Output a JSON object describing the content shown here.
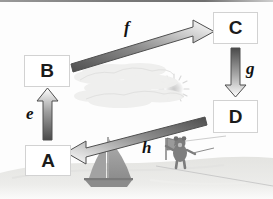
{
  "diagram": {
    "nodes": [
      {
        "id": "A",
        "label": "A",
        "position": "bottom-left"
      },
      {
        "id": "B",
        "label": "B",
        "position": "upper-left"
      },
      {
        "id": "C",
        "label": "C",
        "position": "top-right"
      },
      {
        "id": "D",
        "label": "D",
        "position": "middle-right"
      }
    ],
    "edges": [
      {
        "id": "e",
        "label": "e",
        "from": "A",
        "to": "B",
        "direction": "up"
      },
      {
        "id": "f",
        "label": "f",
        "from": "B",
        "to": "C",
        "direction": "up-right"
      },
      {
        "id": "g",
        "label": "g",
        "from": "C",
        "to": "D",
        "direction": "down"
      },
      {
        "id": "h",
        "label": "h",
        "from": "D",
        "to": "A",
        "direction": "down-left"
      }
    ],
    "colors": {
      "arrow_dark": "#5f5f5f",
      "arrow_light": "#d8d8d8",
      "arrow_outline": "#4a4a4a",
      "box_border": "#d2d2d2",
      "box_fill": "#ffffff",
      "text": "#1b1b1b",
      "ground": "#e8e8e6",
      "sky": "#fdfdfd",
      "boat": "#9c9c9c",
      "figure": "#7c7c7c",
      "top_rule": "#7a7a7a"
    },
    "background_scene": {
      "name": "seaside-illustration",
      "elements": [
        {
          "name": "sun",
          "label": "sun"
        },
        {
          "name": "clouds",
          "label": "clouds"
        },
        {
          "name": "ground",
          "label": "shoreline"
        },
        {
          "name": "sailboat",
          "label": "sailboat"
        },
        {
          "name": "figure-with-flag",
          "label": "figure holding flag"
        },
        {
          "name": "fishing-line",
          "label": "line"
        }
      ]
    }
  }
}
